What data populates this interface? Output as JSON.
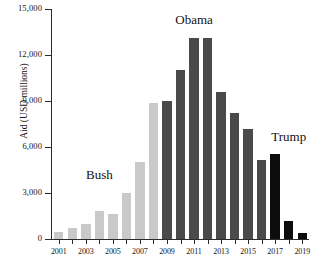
{
  "chart_data": {
    "type": "bar",
    "title": "",
    "xlabel": "",
    "ylabel": "Aid (USD millions)",
    "ylim": [
      0,
      15000
    ],
    "ytick_values": [
      0,
      3000,
      6000,
      9000,
      12000,
      15000
    ],
    "ytick_labels": [
      "0",
      "3,000",
      "6,000",
      "9,000",
      "12,000",
      "15,000"
    ],
    "xtick_labels": [
      "2001",
      "2003",
      "2005",
      "2007",
      "2009",
      "2011",
      "2013",
      "2015",
      "2017",
      "2019"
    ],
    "grid": false,
    "legend": "none",
    "categories": [
      "2001",
      "2002",
      "2003",
      "2004",
      "2005",
      "2006",
      "2007",
      "2008",
      "2009",
      "2010",
      "2011",
      "2012",
      "2013",
      "2014",
      "2015",
      "2016",
      "2017",
      "2018",
      "2019"
    ],
    "values": [
      450,
      700,
      1000,
      1800,
      1650,
      3000,
      5000,
      8900,
      9000,
      11000,
      13100,
      13100,
      9600,
      8200,
      7200,
      5150,
      5550,
      1150,
      400
    ],
    "bar_colors": [
      "#c9c9c9",
      "#c9c9c9",
      "#c9c9c9",
      "#c9c9c9",
      "#c9c9c9",
      "#c9c9c9",
      "#c9c9c9",
      "#c9c9c9",
      "#4a4a4a",
      "#4a4a4a",
      "#4a4a4a",
      "#4a4a4a",
      "#4a4a4a",
      "#4a4a4a",
      "#4a4a4a",
      "#4a4a4a",
      "#0d0d0d",
      "#0d0d0d",
      "#0d0d0d"
    ],
    "annotations": [
      {
        "text": "Bush",
        "x_category": "2004",
        "y_value": 4150
      },
      {
        "text": "Obama",
        "x_category": "2011",
        "y_value": 14300
      },
      {
        "text": "Trump",
        "x_category": "2018",
        "y_value": 6650
      }
    ],
    "series_groups": [
      {
        "name": "Bush",
        "color": "#c9c9c9",
        "years": [
          "2001",
          "2002",
          "2003",
          "2004",
          "2005",
          "2006",
          "2007",
          "2008"
        ]
      },
      {
        "name": "Obama",
        "color": "#4a4a4a",
        "years": [
          "2009",
          "2010",
          "2011",
          "2012",
          "2013",
          "2014",
          "2015",
          "2016"
        ]
      },
      {
        "name": "Trump",
        "color": "#0d0d0d",
        "years": [
          "2017",
          "2018",
          "2019"
        ]
      }
    ]
  }
}
